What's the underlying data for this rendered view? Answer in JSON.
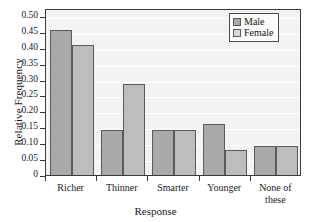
{
  "chart_data": {
    "type": "bar",
    "title": "",
    "xlabel": "Response",
    "ylabel": "Relative Frequency",
    "categories": [
      "Richer",
      "Thinner",
      "Smarter",
      "Younger",
      "None of these"
    ],
    "series": [
      {
        "name": "Male",
        "values": [
          0.455,
          0.14,
          0.14,
          0.16,
          0.09
        ],
        "color": "#a9a9a9"
      },
      {
        "name": "Female",
        "values": [
          0.41,
          0.285,
          0.14,
          0.08,
          0.09
        ],
        "color": "#bdbdbd"
      }
    ],
    "ylim": [
      0,
      0.525
    ],
    "yticks": [
      0,
      0.05,
      0.1,
      0.15,
      0.2,
      0.25,
      0.3,
      0.35,
      0.4,
      0.45,
      0.5
    ],
    "ytick_labels": [
      "0",
      "0.05",
      "0.10",
      "0.15",
      "0.20",
      "0.25",
      "0.30",
      "0.35",
      "0.40",
      "0.45",
      "0.50"
    ],
    "grid": true,
    "legend_position": "top-right",
    "plot_background": "#f3f3f3",
    "axis_color": "#3a3a3a"
  },
  "legend": {
    "items": [
      {
        "label": "Male"
      },
      {
        "label": "Female"
      }
    ]
  },
  "xaxis": {
    "title": "Response",
    "labels": [
      {
        "line1": "Richer",
        "line2": ""
      },
      {
        "line1": "Thinner",
        "line2": ""
      },
      {
        "line1": "Smarter",
        "line2": ""
      },
      {
        "line1": "Younger",
        "line2": ""
      },
      {
        "line1": "None of",
        "line2": "these"
      }
    ]
  },
  "yaxis": {
    "title": "Relative Frequency"
  }
}
